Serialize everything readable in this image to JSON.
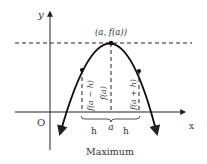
{
  "diagram": {
    "title": "Maximum",
    "axes": {
      "x_label": "x",
      "y_label": "y",
      "origin_label": "O"
    },
    "vertex_label": "(a, f(a))",
    "value_labels": {
      "left": "f(a − h)",
      "center": "f(a)",
      "right": "f(a + h)"
    },
    "axis_labels": {
      "left_h": "h",
      "center_a": "a",
      "right_h": "h"
    },
    "colors": {
      "stroke": "#222222",
      "text": "#333333",
      "background": "#ffffff"
    }
  }
}
